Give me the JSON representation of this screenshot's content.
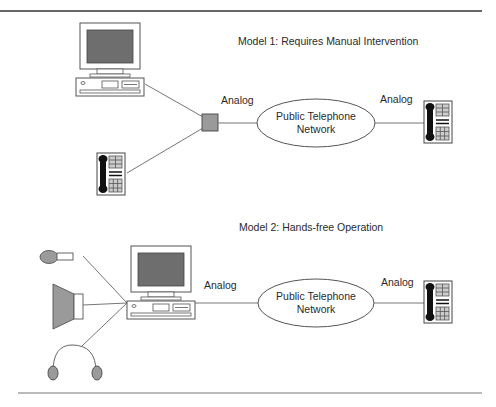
{
  "model1": {
    "title": "Model 1: Requires Manual Intervention",
    "label_left": "Analog",
    "label_right": "Analog",
    "network_line1": "Public Telephone",
    "network_line2": "Network",
    "devices": [
      "computer-icon",
      "modem-box-icon",
      "telephone-icon",
      "remote-telephone-icon"
    ]
  },
  "model2": {
    "title": "Model 2: Hands-free Operation",
    "label_left": "Analog",
    "label_right": "Analog",
    "network_line1": "Public Telephone",
    "network_line2": "Network",
    "devices": [
      "microphone-icon",
      "speaker-icon",
      "headset-icon",
      "computer-icon",
      "remote-telephone-icon"
    ]
  },
  "colors": {
    "line": "#555555",
    "screen": "#6e6e6e",
    "modem_fill": "#9a9a9a",
    "rule": "#333333"
  }
}
